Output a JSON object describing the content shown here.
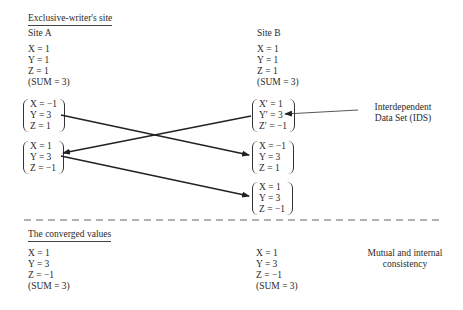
{
  "top": {
    "heading": "Exclusive-writer's site",
    "site_a": {
      "title": "Site A",
      "initial": [
        "X = 1",
        "Y = 1",
        "Z = 1",
        "(SUM = 3)"
      ],
      "group1": [
        "X = −1",
        "Y = 3",
        "Z = 1"
      ],
      "group2": [
        "X = 1",
        "Y = 3",
        "Z = −1"
      ]
    },
    "site_b": {
      "title": "Site B",
      "initial": [
        "X = 1",
        "Y = 1",
        "Z = 1",
        "(SUM = 3)"
      ],
      "ids_group": [
        "X′ = 1",
        "Y′ = 3",
        "Z′ = −1"
      ],
      "group2": [
        "X = −1",
        "Y = 3",
        "Z = 1"
      ],
      "group3": [
        "X = 1",
        "Y = 3",
        "Z = −1"
      ]
    },
    "ids_label": [
      "Interdependent",
      "Data Set (IDS)"
    ]
  },
  "bottom": {
    "heading": "The converged values",
    "site_a": [
      "X = 1",
      "Y = 3",
      "Z = −1",
      "(SUM = 3)"
    ],
    "site_b": [
      "X = 1",
      "Y = 3",
      "Z = −1",
      "(SUM = 3)"
    ],
    "note": [
      "Mutual and internal",
      "consistency"
    ]
  },
  "arrows": [
    {
      "from": "site_a.group1",
      "to": "site_b.group2"
    },
    {
      "from": "site_b.ids_group",
      "to": "site_a.group2"
    },
    {
      "from": "site_a.group2",
      "to": "site_b.group3"
    },
    {
      "from": "ids_label",
      "to": "site_b.ids_group"
    }
  ]
}
